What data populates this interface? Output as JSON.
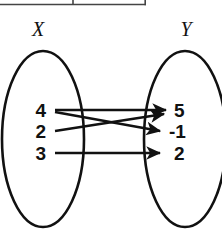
{
  "diagram": {
    "type": "mapping-diagram",
    "title": "",
    "domain_set": {
      "label": "X",
      "elements": [
        "4",
        "2",
        "3"
      ]
    },
    "range_set": {
      "label": "Y",
      "elements": [
        "5",
        "-1",
        "2"
      ]
    },
    "mappings": [
      {
        "from": "4",
        "to": "5",
        "style": "horizontal"
      },
      {
        "from": "4",
        "to": "-1",
        "style": "diagonal-down"
      },
      {
        "from": "2",
        "to": "5",
        "style": "diagonal-up"
      },
      {
        "from": "3",
        "to": "2",
        "style": "horizontal"
      }
    ],
    "colors": {
      "ink": "#111111",
      "background": "#ffffff",
      "table_rule": "#444444"
    }
  },
  "table_fragment": {
    "description": "bottom edge of a two-column table cropped at top of image",
    "visible": true
  }
}
